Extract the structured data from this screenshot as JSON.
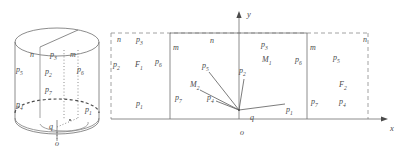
{
  "figure": {
    "stroke_color": "#6f6f6f",
    "text_color": "#4a4a4a",
    "dash_color": "#8a8a8a"
  },
  "cylinder": {
    "name": "cylinder-diagram",
    "labels": [
      {
        "id": "cyl-n",
        "text": "n",
        "sub": "",
        "x": 31,
        "y": 55
      },
      {
        "id": "cyl-p3",
        "text": "p",
        "sub": "3",
        "x": 51,
        "y": 55
      },
      {
        "id": "cyl-m",
        "text": "m",
        "sub": "",
        "x": 71,
        "y": 55
      },
      {
        "id": "cyl-p5",
        "text": "p",
        "sub": "5",
        "x": 17,
        "y": 70
      },
      {
        "id": "cyl-p2",
        "text": "p",
        "sub": "2",
        "x": 46,
        "y": 72
      },
      {
        "id": "cyl-p6",
        "text": "p",
        "sub": "6",
        "x": 78,
        "y": 70
      },
      {
        "id": "cyl-p7",
        "text": "p",
        "sub": "7",
        "x": 46,
        "y": 90
      },
      {
        "id": "cyl-p4",
        "text": "p",
        "sub": "4",
        "x": 17,
        "y": 105
      },
      {
        "id": "cyl-p1",
        "text": "p",
        "sub": "1",
        "x": 86,
        "y": 110
      },
      {
        "id": "cyl-q",
        "text": "q",
        "sub": "",
        "x": 50,
        "y": 127
      },
      {
        "id": "cyl-o",
        "text": "o",
        "sub": "",
        "x": 56,
        "y": 144
      }
    ]
  },
  "plane": {
    "name": "unrolled-plane-diagram",
    "axis_labels": {
      "y": "y",
      "x": "x",
      "origin": "o"
    },
    "labels": [
      {
        "id": "pl-n-left",
        "text": "n",
        "sub": "",
        "x": 118,
        "y": 40
      },
      {
        "id": "pl-p3-left",
        "text": "p",
        "sub": "3",
        "x": 137,
        "y": 40
      },
      {
        "id": "pl-m-left",
        "text": "m",
        "sub": "",
        "x": 174,
        "y": 48
      },
      {
        "id": "pl-n-mid",
        "text": "n",
        "sub": "",
        "x": 211,
        "y": 41
      },
      {
        "id": "pl-p3-mid",
        "text": "p",
        "sub": "3",
        "x": 262,
        "y": 45
      },
      {
        "id": "pl-m-right",
        "text": "m",
        "sub": "",
        "x": 311,
        "y": 48
      },
      {
        "id": "pl-n-far",
        "text": "n",
        "sub": "",
        "x": 364,
        "y": 40
      },
      {
        "id": "pl-p2-left",
        "text": "p",
        "sub": "2",
        "x": 114,
        "y": 65
      },
      {
        "id": "pl-F1",
        "text": "F",
        "sub": "1",
        "x": 136,
        "y": 65
      },
      {
        "id": "pl-p6-left",
        "text": "p",
        "sub": "6",
        "x": 156,
        "y": 62
      },
      {
        "id": "pl-M1",
        "text": "M",
        "sub": "1",
        "x": 263,
        "y": 60
      },
      {
        "id": "pl-p6-right",
        "text": "p",
        "sub": "6",
        "x": 296,
        "y": 60
      },
      {
        "id": "pl-p5-right",
        "text": "p",
        "sub": "5",
        "x": 334,
        "y": 58
      },
      {
        "id": "pl-F2",
        "text": "F",
        "sub": "2",
        "x": 340,
        "y": 85
      },
      {
        "id": "pl-p1-left",
        "text": "p",
        "sub": "1",
        "x": 137,
        "y": 104
      },
      {
        "id": "pl-p7-left",
        "text": "p",
        "sub": "7",
        "x": 176,
        "y": 98
      },
      {
        "id": "pl-p7-right",
        "text": "p",
        "sub": "7",
        "x": 312,
        "y": 102
      },
      {
        "id": "pl-p4-right",
        "text": "p",
        "sub": "4",
        "x": 340,
        "y": 102
      },
      {
        "id": "pl-p1-mid",
        "text": "p",
        "sub": "1",
        "x": 287,
        "y": 110
      },
      {
        "id": "pl-p5-vec",
        "text": "p",
        "sub": "5",
        "x": 203,
        "y": 66
      },
      {
        "id": "pl-p2-vec",
        "text": "p",
        "sub": "2",
        "x": 240,
        "y": 71
      },
      {
        "id": "pl-M2",
        "text": "M",
        "sub": "2",
        "x": 191,
        "y": 85
      },
      {
        "id": "pl-p4-vec",
        "text": "p",
        "sub": "4",
        "x": 208,
        "y": 98
      },
      {
        "id": "pl-q",
        "text": "q",
        "sub": "",
        "x": 251,
        "y": 118
      },
      {
        "id": "pl-o",
        "text": "o",
        "sub": "",
        "x": 241,
        "y": 133
      },
      {
        "id": "pl-y",
        "text": "y",
        "sub": "",
        "x": 248,
        "y": 14
      },
      {
        "id": "pl-x",
        "text": "x",
        "sub": "",
        "x": 391,
        "y": 128
      }
    ]
  }
}
